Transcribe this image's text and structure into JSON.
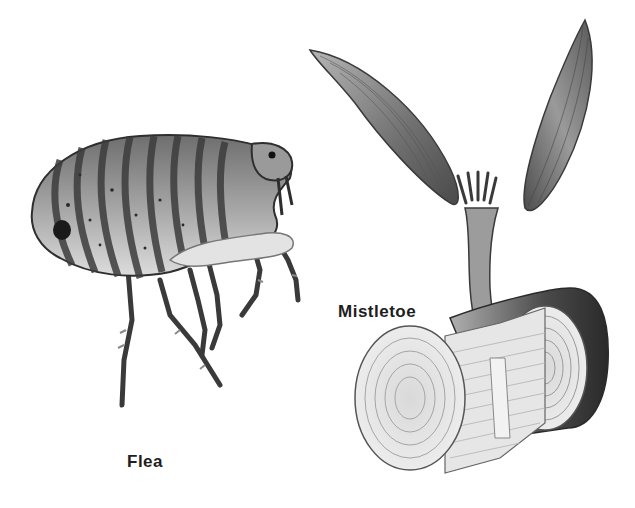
{
  "illustration": {
    "style": "grayscale scientific drawing",
    "background": "#ffffff",
    "ink_color": "#1e1e1e"
  },
  "figures": [
    {
      "name": "flea",
      "label": "Flea",
      "description": "side view of a flea with striped segmented body and long jointed legs"
    },
    {
      "name": "mistletoe",
      "label": "Mistletoe",
      "description": "mistletoe seedling with two leaves growing from a cutaway branch section showing growth rings"
    }
  ]
}
